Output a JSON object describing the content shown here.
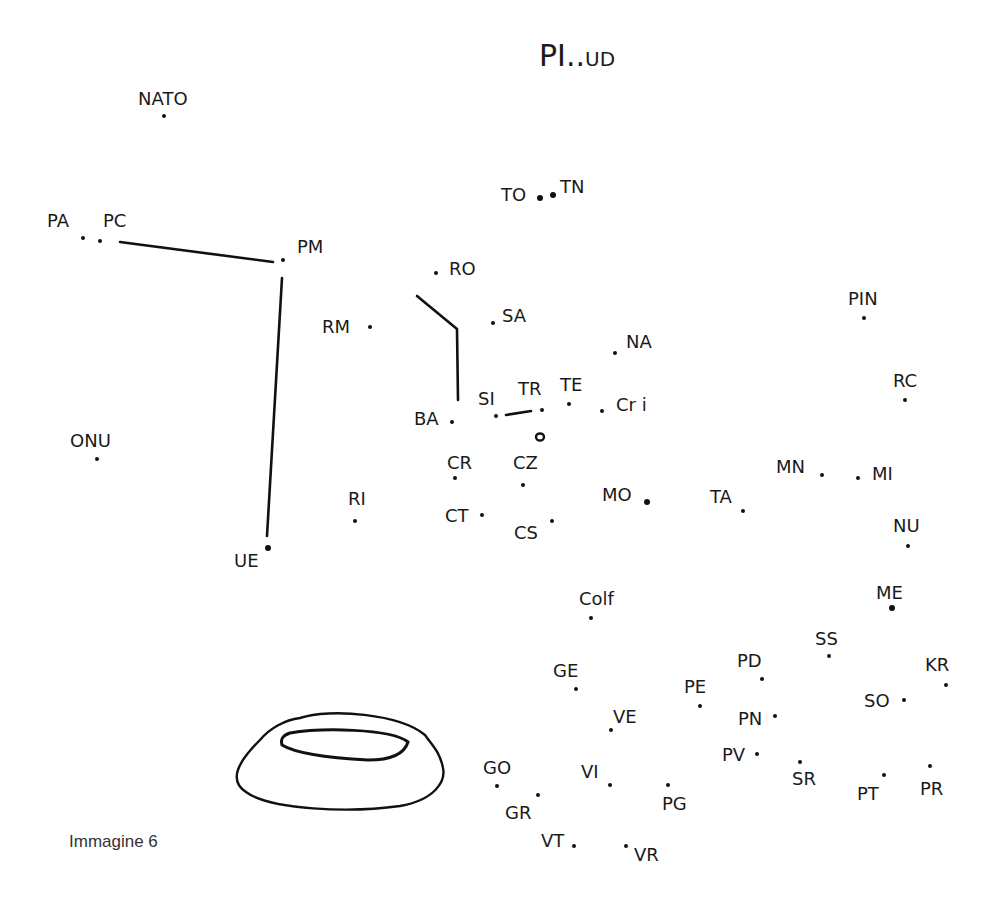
{
  "title": {
    "main": "PI",
    "dots": "..",
    "sub": "UD"
  },
  "caption": "Immagine 6",
  "points": [
    {
      "id": "NATO",
      "label": "NATO",
      "lx": 138,
      "ly": 90,
      "dx": 164,
      "dy": 116
    },
    {
      "id": "PA",
      "label": "PA",
      "lx": 47,
      "ly": 212,
      "dx": 83,
      "dy": 238
    },
    {
      "id": "PC",
      "label": "PC",
      "lx": 103,
      "ly": 212,
      "dx": 100,
      "dy": 241
    },
    {
      "id": "PM",
      "label": "PM",
      "lx": 297,
      "ly": 238,
      "dx": 283,
      "dy": 260
    },
    {
      "id": "TO",
      "label": "TO",
      "lx": 501,
      "ly": 186,
      "dx": 540,
      "dy": 198
    },
    {
      "id": "TN",
      "label": "TN",
      "lx": 560,
      "ly": 178,
      "dx": 553,
      "dy": 195
    },
    {
      "id": "RO",
      "label": "RO",
      "lx": 449,
      "ly": 260,
      "dx": 436,
      "dy": 273
    },
    {
      "id": "SA",
      "label": "SA",
      "lx": 502,
      "ly": 307,
      "dx": 493,
      "dy": 323
    },
    {
      "id": "RM",
      "label": "RM",
      "lx": 322,
      "ly": 318,
      "dx": 370,
      "dy": 327
    },
    {
      "id": "PIN",
      "label": "PIN",
      "lx": 848,
      "ly": 290,
      "dx": 864,
      "dy": 318
    },
    {
      "id": "NA",
      "label": "NA",
      "lx": 626,
      "ly": 333,
      "dx": 615,
      "dy": 353
    },
    {
      "id": "RC",
      "label": "RC",
      "lx": 893,
      "ly": 372,
      "dx": 905,
      "dy": 400
    },
    {
      "id": "BA",
      "label": "BA",
      "lx": 414,
      "ly": 410,
      "dx": 452,
      "dy": 422
    },
    {
      "id": "SI",
      "label": "SI",
      "lx": 478,
      "ly": 390,
      "dx": 496,
      "dy": 416
    },
    {
      "id": "TR",
      "label": "TR",
      "lx": 518,
      "ly": 380,
      "dx": 542,
      "dy": 410
    },
    {
      "id": "TE",
      "label": "TE",
      "lx": 560,
      "ly": 376,
      "dx": 569,
      "dy": 404
    },
    {
      "id": "Cri",
      "label": "Cr i",
      "lx": 616,
      "ly": 396,
      "dx": 602,
      "dy": 411
    },
    {
      "id": "CR",
      "label": "CR",
      "lx": 447,
      "ly": 454,
      "dx": 455,
      "dy": 478
    },
    {
      "id": "CZ",
      "label": "CZ",
      "lx": 513,
      "ly": 454,
      "dx": 523,
      "dy": 485
    },
    {
      "id": "ONU",
      "label": "ONU",
      "lx": 70,
      "ly": 432,
      "dx": 97,
      "dy": 459
    },
    {
      "id": "MN",
      "label": "MN",
      "lx": 776,
      "ly": 458,
      "dx": 822,
      "dy": 475
    },
    {
      "id": "MI",
      "label": "MI",
      "lx": 872,
      "ly": 465,
      "dx": 858,
      "dy": 478
    },
    {
      "id": "MO",
      "label": "MO",
      "lx": 602,
      "ly": 486,
      "dx": 647,
      "dy": 502
    },
    {
      "id": "TA",
      "label": "TA",
      "lx": 710,
      "ly": 488,
      "dx": 743,
      "dy": 511
    },
    {
      "id": "RI",
      "label": "RI",
      "lx": 348,
      "ly": 490,
      "dx": 355,
      "dy": 521
    },
    {
      "id": "CT",
      "label": "CT",
      "lx": 445,
      "ly": 507,
      "dx": 482,
      "dy": 515
    },
    {
      "id": "CS",
      "label": "CS",
      "lx": 514,
      "ly": 524,
      "dx": 552,
      "dy": 521
    },
    {
      "id": "NU",
      "label": "NU",
      "lx": 893,
      "ly": 517,
      "dx": 908,
      "dy": 546
    },
    {
      "id": "UE",
      "label": "UE",
      "lx": 234,
      "ly": 552,
      "dx": 268,
      "dy": 548
    },
    {
      "id": "Colf",
      "label": "Colf",
      "lx": 579,
      "ly": 590,
      "dx": 591,
      "dy": 618
    },
    {
      "id": "ME",
      "label": "ME",
      "lx": 876,
      "ly": 584,
      "dx": 892,
      "dy": 608
    },
    {
      "id": "SS",
      "label": "SS",
      "lx": 815,
      "ly": 630,
      "dx": 829,
      "dy": 656
    },
    {
      "id": "PD",
      "label": "PD",
      "lx": 737,
      "ly": 652,
      "dx": 762,
      "dy": 679
    },
    {
      "id": "KR",
      "label": "KR",
      "lx": 925,
      "ly": 656,
      "dx": 946,
      "dy": 685
    },
    {
      "id": "GE",
      "label": "GE",
      "lx": 553,
      "ly": 662,
      "dx": 576,
      "dy": 689
    },
    {
      "id": "PE",
      "label": "PE",
      "lx": 684,
      "ly": 678,
      "dx": 700,
      "dy": 706
    },
    {
      "id": "SO",
      "label": "SO",
      "lx": 864,
      "ly": 692,
      "dx": 904,
      "dy": 700
    },
    {
      "id": "VE",
      "label": "VE",
      "lx": 613,
      "ly": 708,
      "dx": 611,
      "dy": 730
    },
    {
      "id": "PN",
      "label": "PN",
      "lx": 738,
      "ly": 710,
      "dx": 775,
      "dy": 716
    },
    {
      "id": "PV",
      "label": "PV",
      "lx": 722,
      "ly": 746,
      "dx": 757,
      "dy": 754
    },
    {
      "id": "GO",
      "label": "GO",
      "lx": 483,
      "ly": 759,
      "dx": 497,
      "dy": 786
    },
    {
      "id": "VI",
      "label": "VI",
      "lx": 581,
      "ly": 763,
      "dx": 610,
      "dy": 785
    },
    {
      "id": "SR",
      "label": "SR",
      "lx": 792,
      "ly": 770,
      "dx": 800,
      "dy": 762
    },
    {
      "id": "PG",
      "label": "PG",
      "lx": 662,
      "ly": 795,
      "dx": 668,
      "dy": 785
    },
    {
      "id": "GR",
      "label": "GR",
      "lx": 505,
      "ly": 804,
      "dx": 538,
      "dy": 795
    },
    {
      "id": "PT",
      "label": "PT",
      "lx": 857,
      "ly": 785,
      "dx": 884,
      "dy": 775
    },
    {
      "id": "PR",
      "label": "PR",
      "lx": 920,
      "ly": 780,
      "dx": 930,
      "dy": 766
    },
    {
      "id": "VT",
      "label": "VT",
      "lx": 541,
      "ly": 832,
      "dx": 574,
      "dy": 846
    },
    {
      "id": "VR",
      "label": "VR",
      "lx": 634,
      "ly": 846,
      "dx": 626,
      "dy": 846
    }
  ],
  "big_dots": [
    "TO",
    "TN",
    "MO",
    "ME",
    "UE"
  ],
  "drawn_lines": [
    {
      "name": "pc-to-pm-line",
      "points": "120,242 273,262"
    },
    {
      "name": "pm-to-ue-line",
      "points": "282,278 267,536"
    },
    {
      "name": "ro-to-ba-line",
      "points": "417,296 457,329 458,400"
    },
    {
      "name": "si-to-tr-line",
      "points": "506,415 531,411"
    }
  ],
  "colors": {
    "ink": "#111111",
    "caption": "#333333",
    "background": "#ffffff"
  }
}
